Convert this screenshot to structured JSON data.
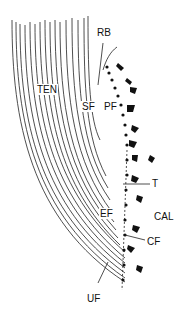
{
  "diagram": {
    "labels": {
      "ten": "TEN",
      "rb": "RB",
      "sf": "SF",
      "pf": "PF",
      "t": "T",
      "cal": "CAL",
      "ef": "EF",
      "cf": "CF",
      "uf": "UF"
    },
    "colors": {
      "line": "#111111",
      "background": "#ffffff"
    }
  }
}
